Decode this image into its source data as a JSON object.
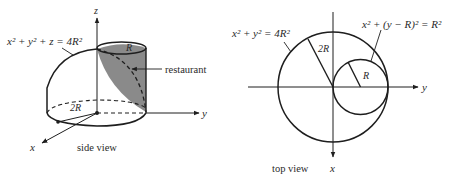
{
  "colors": {
    "ink": "#1e1e1e",
    "shade": "#8a8a8a",
    "background": "#ffffff"
  },
  "side_view": {
    "caption": "side view",
    "surface_equation": {
      "lhs_x": "x",
      "lhs_y": "y",
      "lhs_z": "z",
      "plus": "+",
      "equals": "=",
      "coef": "4",
      "rhs_var": "R",
      "exp": "2",
      "full": "x² + y² + z = 4R²"
    },
    "axis_labels": {
      "x": "x",
      "y": "y",
      "z": "z"
    },
    "radius_label": "2R",
    "cylinder_radius_label": "R",
    "restaurant_label": "restaurant"
  },
  "top_view": {
    "caption": "top view",
    "big_circle_equation": "x² + y² = 4R²",
    "small_circle_equation": "x² + (y − R)² = R²",
    "axis_labels": {
      "x": "x",
      "y": "y"
    },
    "big_radius_label": "2R",
    "small_radius_label": "R"
  }
}
